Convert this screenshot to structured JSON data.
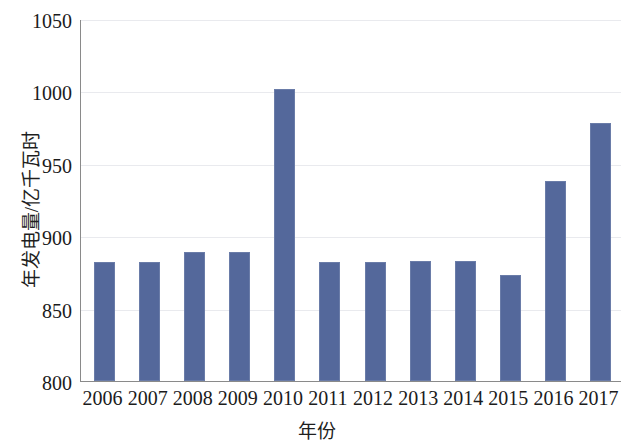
{
  "chart_data": {
    "type": "bar",
    "title": "",
    "xlabel": "年份",
    "ylabel": "年发电量/亿千瓦时",
    "categories": [
      "2006",
      "2007",
      "2008",
      "2009",
      "2010",
      "2011",
      "2012",
      "2013",
      "2014",
      "2015",
      "2016",
      "2017"
    ],
    "values": [
      882,
      882,
      889,
      889,
      1002,
      882,
      882,
      883,
      883,
      873,
      938,
      978
    ],
    "ylim": [
      800,
      1050
    ],
    "yticks": [
      800,
      850,
      900,
      950,
      1000,
      1050
    ],
    "ytick_labels": [
      "800",
      "850",
      "900",
      "950",
      "1000",
      "1050"
    ],
    "grid": true,
    "legend": false,
    "series_color": "#54689b",
    "axis_color": "#8a8a8a",
    "grid_color": "#e9eaee"
  }
}
